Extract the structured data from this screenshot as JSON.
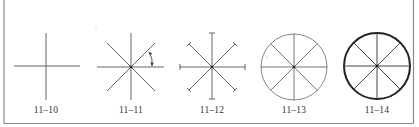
{
  "figures": [
    {
      "id": "fig-11-10",
      "label": "11–10",
      "description": "plain cross (horizontal and vertical axes)"
    },
    {
      "id": "fig-11-11",
      "label": "11–11",
      "description": "eight-spoke star with 45° angle arc arrow"
    },
    {
      "id": "fig-11-12",
      "label": "11–12",
      "description": "eight-spoke star with T-bar end caps"
    },
    {
      "id": "fig-11-13",
      "label": "11–13",
      "description": "eight-spoke wheel with thin circle"
    },
    {
      "id": "fig-11-14",
      "label": "11–14",
      "description": "eight-spoke wheel with heavy circle"
    }
  ],
  "colors": {
    "line": "#555555",
    "thin_circle": "#777777",
    "heavy_circle": "#222222",
    "frame": "#777777",
    "label": "#333333"
  }
}
